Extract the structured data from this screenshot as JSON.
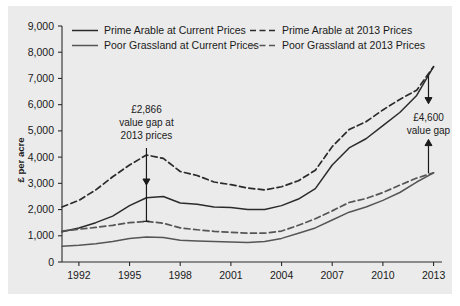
{
  "chart_data": {
    "type": "line",
    "title": "",
    "xlabel": "",
    "ylabel": "£ per acre",
    "xlim": [
      1991,
      2013.5
    ],
    "ylim": [
      0,
      9000
    ],
    "grid": false,
    "legend_position": "top-inside",
    "x_ticks": [
      "1992",
      "1995",
      "1998",
      "2001",
      "2004",
      "2007",
      "2010",
      "2013"
    ],
    "x_tick_values": [
      1992,
      1995,
      1998,
      2001,
      2004,
      2007,
      2010,
      2013
    ],
    "y_ticks": [
      "0",
      "1,000",
      "2,000",
      "3,000",
      "4,000",
      "5,000",
      "6,000",
      "7,000",
      "8,000",
      "9,000"
    ],
    "y_tick_values": [
      0,
      1000,
      2000,
      3000,
      4000,
      5000,
      6000,
      7000,
      8000,
      9000
    ],
    "x": [
      1991,
      1992,
      1993,
      1994,
      1995,
      1996,
      1997,
      1998,
      1999,
      2000,
      2001,
      2002,
      2003,
      2004,
      2005,
      2006,
      2007,
      2008,
      2009,
      2010,
      2011,
      2012,
      2013
    ],
    "series": [
      {
        "name": "Prime Arable at Current Prices",
        "style": "solid",
        "color": "#2b2b2b",
        "values": [
          1150,
          1300,
          1500,
          1750,
          2150,
          2450,
          2500,
          2250,
          2200,
          2100,
          2080,
          2000,
          2000,
          2150,
          2400,
          2800,
          3700,
          4350,
          4700,
          5200,
          5700,
          6350,
          7450
        ]
      },
      {
        "name": "Poor Grassland at Current Prices",
        "style": "solid",
        "color": "#555555",
        "values": [
          600,
          640,
          700,
          780,
          900,
          950,
          930,
          830,
          800,
          780,
          760,
          740,
          780,
          900,
          1100,
          1300,
          1600,
          1900,
          2100,
          2350,
          2650,
          3050,
          3400
        ]
      },
      {
        "name": "Prime Arable at 2013 Prices",
        "style": "dashed",
        "color": "#2b2b2b",
        "values": [
          2100,
          2350,
          2750,
          3250,
          3700,
          4080,
          3950,
          3450,
          3300,
          3050,
          2950,
          2820,
          2750,
          2870,
          3100,
          3500,
          4400,
          5050,
          5350,
          5800,
          6200,
          6550,
          7450
        ]
      },
      {
        "name": "Poor Grassland at 2013 Prices",
        "style": "dashed",
        "color": "#555555",
        "values": [
          1180,
          1250,
          1320,
          1400,
          1500,
          1550,
          1480,
          1300,
          1230,
          1170,
          1130,
          1100,
          1100,
          1180,
          1400,
          1650,
          1950,
          2270,
          2420,
          2650,
          2930,
          3200,
          3400
        ]
      }
    ],
    "annotations": [
      {
        "id": "left-gap",
        "lines": [
          "£2,866",
          "value gap at",
          "2013 prices"
        ],
        "x_year": 1996,
        "arrow_top_value": 4080,
        "arrow_bottom_value": 1550,
        "description": "double-headed arrow between Prime Arable 2013 Prices and Poor Grassland 2013 Prices in 1996"
      },
      {
        "id": "right-gap",
        "lines": [
          "£4,600",
          "value gap"
        ],
        "x_year": 2012.7,
        "arrow_top_value": 7100,
        "arrow_bottom_value": 3380,
        "description": "double-headed arrow between Prime Arable and Poor Grassland at 2013"
      }
    ]
  },
  "legend": {
    "entries": [
      {
        "label": "Prime Arable at Current Prices",
        "style": "solid",
        "color": "#2b2b2b"
      },
      {
        "label": "Poor Grassland at Current Prices",
        "style": "solid",
        "color": "#555555"
      },
      {
        "label": "Prime Arable at 2013 Prices",
        "style": "dashed",
        "color": "#2b2b2b"
      },
      {
        "label": "Poor Grassland at 2013 Prices",
        "style": "dashed",
        "color": "#555555"
      }
    ]
  },
  "axis": {
    "y_title": "£ per acre"
  }
}
